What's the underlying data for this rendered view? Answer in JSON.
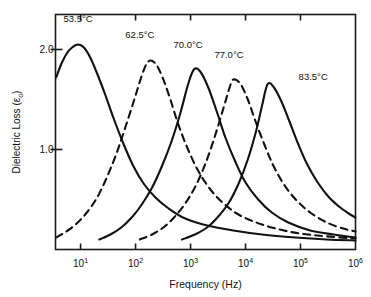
{
  "chart_data": {
    "type": "line",
    "title": "",
    "xlabel": "Frequency (Hz)",
    "ylabel": "Dielectric Loss (εo)",
    "ylabel_base": "Dielectric Loss (ε",
    "ylabel_sub": "o",
    "ylabel_close": ")",
    "x_scale": "log",
    "xlim": [
      3.5,
      1000000
    ],
    "ylim": [
      0.0,
      2.35
    ],
    "grid": false,
    "legend_position": "inline-annotations",
    "x_ticks": [
      {
        "mantissa": "10",
        "exponent": "1",
        "value": 10
      },
      {
        "mantissa": "10",
        "exponent": "2",
        "value": 100
      },
      {
        "mantissa": "10",
        "exponent": "3",
        "value": 1000
      },
      {
        "mantissa": "10",
        "exponent": "4",
        "value": 10000
      },
      {
        "mantissa": "10",
        "exponent": "5",
        "value": 100000
      },
      {
        "mantissa": "10",
        "exponent": "6",
        "value": 1000000
      }
    ],
    "y_ticks": [
      {
        "label": "1.0",
        "value": 1.0
      },
      {
        "label": "2.0",
        "value": 2.0
      }
    ],
    "series": [
      {
        "name": "53.5°C",
        "temperature_c": 53.5,
        "style": "solid",
        "peak_frequency_hz": 9,
        "peak_value": 2.05,
        "label_x_hz": 9,
        "label_y": 2.28,
        "points": [
          {
            "f": 3.6,
            "y": 1.72
          },
          {
            "f": 4.5,
            "y": 1.86
          },
          {
            "f": 5.6,
            "y": 1.96
          },
          {
            "f": 7.0,
            "y": 2.02
          },
          {
            "f": 9.0,
            "y": 2.05
          },
          {
            "f": 11.5,
            "y": 2.02
          },
          {
            "f": 15.0,
            "y": 1.92
          },
          {
            "f": 20.0,
            "y": 1.76
          },
          {
            "f": 28.0,
            "y": 1.55
          },
          {
            "f": 40.0,
            "y": 1.31
          },
          {
            "f": 60.0,
            "y": 1.06
          },
          {
            "f": 90.0,
            "y": 0.84
          },
          {
            "f": 140.0,
            "y": 0.66
          },
          {
            "f": 230.0,
            "y": 0.52
          },
          {
            "f": 400.0,
            "y": 0.41
          },
          {
            "f": 800.0,
            "y": 0.31
          },
          {
            "f": 2000.0,
            "y": 0.24
          },
          {
            "f": 6000.0,
            "y": 0.19
          },
          {
            "f": 20000.0,
            "y": 0.15
          },
          {
            "f": 80000.0,
            "y": 0.12
          },
          {
            "f": 300000.0,
            "y": 0.1
          },
          {
            "f": 1000000.0,
            "y": 0.09
          }
        ]
      },
      {
        "name": "62.5°C",
        "temperature_c": 62.5,
        "style": "dashed",
        "peak_frequency_hz": 170,
        "peak_value": 1.88,
        "label_x_hz": 120,
        "label_y": 2.12,
        "points": [
          {
            "f": 3.6,
            "y": 0.12
          },
          {
            "f": 5.5,
            "y": 0.18
          },
          {
            "f": 8.5,
            "y": 0.26
          },
          {
            "f": 13.0,
            "y": 0.37
          },
          {
            "f": 20.0,
            "y": 0.52
          },
          {
            "f": 30.0,
            "y": 0.72
          },
          {
            "f": 45.0,
            "y": 0.96
          },
          {
            "f": 65.0,
            "y": 1.22
          },
          {
            "f": 95.0,
            "y": 1.5
          },
          {
            "f": 130.0,
            "y": 1.74
          },
          {
            "f": 170.0,
            "y": 1.88
          },
          {
            "f": 230.0,
            "y": 1.86
          },
          {
            "f": 310.0,
            "y": 1.72
          },
          {
            "f": 430.0,
            "y": 1.5
          },
          {
            "f": 600.0,
            "y": 1.25
          },
          {
            "f": 900.0,
            "y": 1.0
          },
          {
            "f": 1400.0,
            "y": 0.78
          },
          {
            "f": 2300.0,
            "y": 0.6
          },
          {
            "f": 4000.0,
            "y": 0.46
          },
          {
            "f": 8000.0,
            "y": 0.34
          },
          {
            "f": 20000.0,
            "y": 0.25
          },
          {
            "f": 60000.0,
            "y": 0.18
          },
          {
            "f": 200000.0,
            "y": 0.14
          },
          {
            "f": 1000000.0,
            "y": 0.11
          }
        ]
      },
      {
        "name": "70.0°C",
        "temperature_c": 70.0,
        "style": "solid",
        "peak_frequency_hz": 1150,
        "peak_value": 1.8,
        "label_x_hz": 900,
        "label_y": 2.02,
        "points": [
          {
            "f": 22.0,
            "y": 0.1
          },
          {
            "f": 35.0,
            "y": 0.15
          },
          {
            "f": 55.0,
            "y": 0.22
          },
          {
            "f": 85.0,
            "y": 0.32
          },
          {
            "f": 130.0,
            "y": 0.45
          },
          {
            "f": 200.0,
            "y": 0.62
          },
          {
            "f": 300.0,
            "y": 0.83
          },
          {
            "f": 450.0,
            "y": 1.08
          },
          {
            "f": 650.0,
            "y": 1.36
          },
          {
            "f": 900.0,
            "y": 1.65
          },
          {
            "f": 1150.0,
            "y": 1.8
          },
          {
            "f": 1500.0,
            "y": 1.78
          },
          {
            "f": 2100.0,
            "y": 1.62
          },
          {
            "f": 3000.0,
            "y": 1.38
          },
          {
            "f": 4300.0,
            "y": 1.12
          },
          {
            "f": 6500.0,
            "y": 0.88
          },
          {
            "f": 10000.0,
            "y": 0.67
          },
          {
            "f": 17000.0,
            "y": 0.5
          },
          {
            "f": 30000.0,
            "y": 0.37
          },
          {
            "f": 60000.0,
            "y": 0.27
          },
          {
            "f": 150000.0,
            "y": 0.19
          },
          {
            "f": 400000.0,
            "y": 0.15
          },
          {
            "f": 1000000.0,
            "y": 0.12
          }
        ]
      },
      {
        "name": "77.0°C",
        "temperature_c": 77.0,
        "style": "dashed",
        "peak_frequency_hz": 6000,
        "peak_value": 1.7,
        "label_x_hz": 5000,
        "label_y": 1.92,
        "points": [
          {
            "f": 120.0,
            "y": 0.1
          },
          {
            "f": 200.0,
            "y": 0.15
          },
          {
            "f": 320.0,
            "y": 0.22
          },
          {
            "f": 500.0,
            "y": 0.32
          },
          {
            "f": 800.0,
            "y": 0.46
          },
          {
            "f": 1250.0,
            "y": 0.64
          },
          {
            "f": 1900.0,
            "y": 0.87
          },
          {
            "f": 2800.0,
            "y": 1.14
          },
          {
            "f": 4000.0,
            "y": 1.42
          },
          {
            "f": 5200.0,
            "y": 1.63
          },
          {
            "f": 6000.0,
            "y": 1.7
          },
          {
            "f": 8000.0,
            "y": 1.66
          },
          {
            "f": 11000.0,
            "y": 1.5
          },
          {
            "f": 15000.0,
            "y": 1.29
          },
          {
            "f": 22000.0,
            "y": 1.05
          },
          {
            "f": 32000.0,
            "y": 0.84
          },
          {
            "f": 50000.0,
            "y": 0.65
          },
          {
            "f": 85000.0,
            "y": 0.49
          },
          {
            "f": 150000.0,
            "y": 0.37
          },
          {
            "f": 300000.0,
            "y": 0.27
          },
          {
            "f": 600000.0,
            "y": 0.21
          },
          {
            "f": 1000000.0,
            "y": 0.18
          }
        ]
      },
      {
        "name": "83.5°C",
        "temperature_c": 83.5,
        "style": "solid",
        "peak_frequency_hz": 25000,
        "peak_value": 1.65,
        "label_x_hz": 170000,
        "label_y": 1.7,
        "points": [
          {
            "f": 700.0,
            "y": 0.1
          },
          {
            "f": 1200.0,
            "y": 0.15
          },
          {
            "f": 2000.0,
            "y": 0.22
          },
          {
            "f": 3200.0,
            "y": 0.33
          },
          {
            "f": 5000.0,
            "y": 0.47
          },
          {
            "f": 7500.0,
            "y": 0.66
          },
          {
            "f": 11000.0,
            "y": 0.9
          },
          {
            "f": 15500.0,
            "y": 1.18
          },
          {
            "f": 20000.0,
            "y": 1.44
          },
          {
            "f": 25000.0,
            "y": 1.65
          },
          {
            "f": 32000.0,
            "y": 1.63
          },
          {
            "f": 45000.0,
            "y": 1.48
          },
          {
            "f": 63000.0,
            "y": 1.28
          },
          {
            "f": 90000.0,
            "y": 1.06
          },
          {
            "f": 130000.0,
            "y": 0.86
          },
          {
            "f": 200000.0,
            "y": 0.68
          },
          {
            "f": 320000.0,
            "y": 0.53
          },
          {
            "f": 500000.0,
            "y": 0.43
          },
          {
            "f": 750000.0,
            "y": 0.36
          },
          {
            "f": 1000000.0,
            "y": 0.32
          }
        ]
      }
    ]
  }
}
